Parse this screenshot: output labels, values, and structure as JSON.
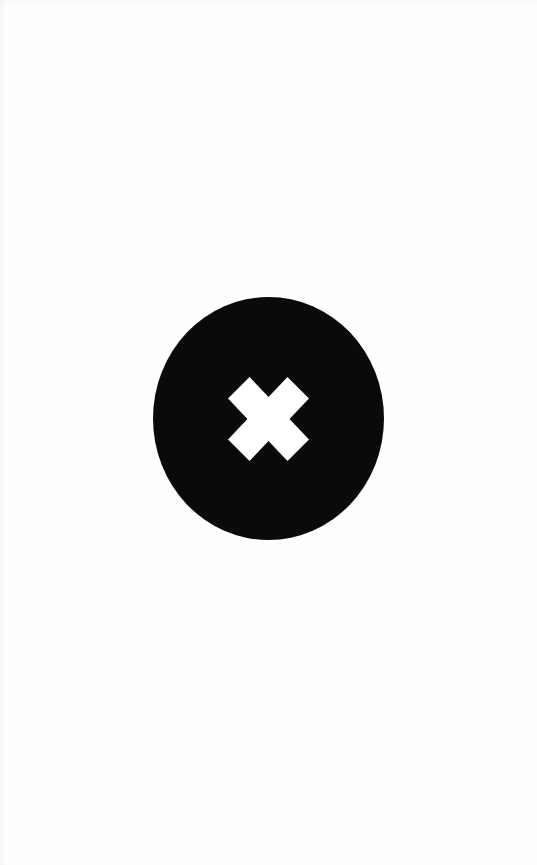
{
  "page": {
    "background_color": "#fefefe",
    "width": 537,
    "height": 865
  },
  "close_button": {
    "name": "close-button",
    "role": "button",
    "aria_label": "Close",
    "tooltip": "Close",
    "shape": "circle",
    "fill_color": "#0a0a0a",
    "diameter_px": 231,
    "center_x": 268,
    "center_y": 418,
    "icon": {
      "name": "close-x-icon",
      "glyph": "✕",
      "color": "#ffffff",
      "width_px": 81,
      "height_px": 84,
      "stroke_style": "thick-diagonal-cross"
    }
  }
}
